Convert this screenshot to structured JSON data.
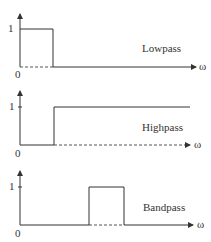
{
  "diagram": {
    "panels": [
      {
        "name": "Lowpass",
        "label": "Lowpass",
        "y_tick_one": "1",
        "origin": "0",
        "x_axis_label": "ω"
      },
      {
        "name": "Highpass",
        "label": "Highpass",
        "y_tick_one": "1",
        "origin": "0",
        "x_axis_label": "ω"
      },
      {
        "name": "Bandpass",
        "label": "Bandpass",
        "y_tick_one": "1",
        "origin": "0",
        "x_axis_label": "ω"
      }
    ],
    "colors": {
      "line": "#333333",
      "dashed": "#555555",
      "background": "#ffffff"
    }
  }
}
